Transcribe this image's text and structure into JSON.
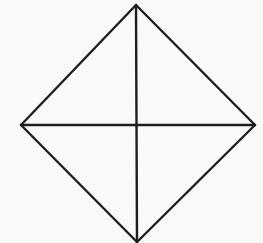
{
  "diagram": {
    "type": "geometric-figure",
    "shape": "rhombus-with-diagonals",
    "background": "#f9f9f8",
    "stroke_color": "#1e1e1e",
    "stroke_width": 2.4,
    "vertices": {
      "top": [
        136,
        5
      ],
      "right": [
        255,
        125
      ],
      "bottom": [
        137,
        242
      ],
      "left": [
        21,
        125
      ]
    },
    "center": [
      137,
      125
    ],
    "segments": [
      {
        "name": "top-right-edge",
        "from": "top",
        "to": "right"
      },
      {
        "name": "right-bottom-edge",
        "from": "right",
        "to": "bottom"
      },
      {
        "name": "bottom-left-edge",
        "from": "bottom",
        "to": "left"
      },
      {
        "name": "left-top-edge",
        "from": "left",
        "to": "top"
      },
      {
        "name": "vertical-diagonal",
        "from": "top",
        "to": "bottom"
      },
      {
        "name": "horizontal-diagonal",
        "from": "left",
        "to": "right"
      }
    ]
  }
}
